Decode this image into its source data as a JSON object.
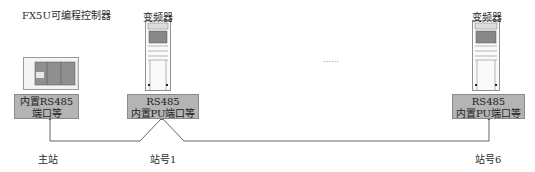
{
  "diagram": {
    "title_plc": "FX5U可编程控制器",
    "plc": {
      "port_line1": "内置RS485",
      "port_line2": "端口等",
      "station_label": "主站"
    },
    "inverters": [
      {
        "title": "变频器",
        "port_line1": "RS485",
        "port_line2": "内置PU端口等",
        "station_label": "站号1"
      },
      {
        "title": "变频器",
        "port_line1": "RS485",
        "port_line2": "内置PU端口等",
        "station_label": "站号6"
      }
    ],
    "ellipsis": "……",
    "colors": {
      "port_box_fill": "#b4b4b4",
      "plc_body_fill": "#8c8c8c",
      "line": "#555555"
    }
  }
}
